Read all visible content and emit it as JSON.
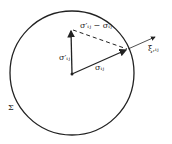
{
  "labels": {
    "sigma_prime": "σ′ᵢⱼ",
    "sigma": "σᵢⱼ",
    "difference": "σ′ᵢⱼ − σᵢⱼ",
    "xi": "ξ,ᵢⱼ",
    "surface": "Σ"
  },
  "colors": {
    "stroke": "#222222",
    "background": "#ffffff"
  }
}
